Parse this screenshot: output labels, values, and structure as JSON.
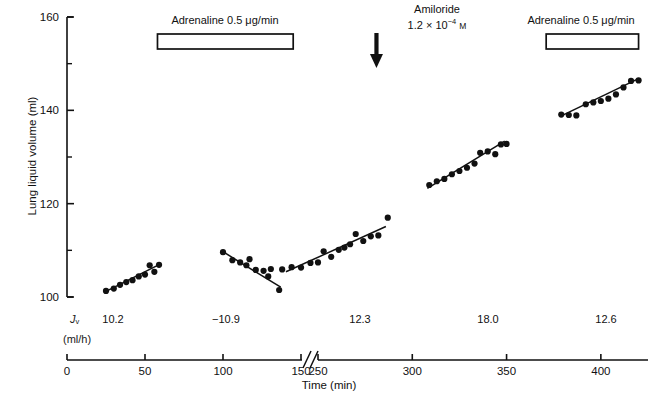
{
  "chart_data": {
    "type": "scatter",
    "title": "",
    "xlabel": "Time (min)",
    "ylabel": "Lung liquid volume (ml)",
    "xlim": [
      0,
      425
    ],
    "ylim": [
      100,
      160
    ],
    "grid": false,
    "legend": "none",
    "x_ticks": [
      0,
      50,
      100,
      150,
      250,
      300,
      350,
      400
    ],
    "y_ticks": [
      100,
      120,
      140,
      160
    ],
    "y_minor_ticks": [
      110,
      130,
      150
    ],
    "axis_break": {
      "after": 150,
      "before": 250,
      "symbol": "//"
    },
    "series": [
      {
        "name": "control-1",
        "jv": 10.2,
        "points": [
          {
            "x": 25,
            "y": 101.3
          },
          {
            "x": 30,
            "y": 101.8
          },
          {
            "x": 34,
            "y": 102.6
          },
          {
            "x": 38,
            "y": 103.2
          },
          {
            "x": 42,
            "y": 103.6
          },
          {
            "x": 46,
            "y": 104.4
          },
          {
            "x": 50,
            "y": 104.8
          },
          {
            "x": 53,
            "y": 106.8
          },
          {
            "x": 56,
            "y": 105.4
          },
          {
            "x": 59,
            "y": 106.9
          }
        ],
        "fit": {
          "x1": 25,
          "y1": 101.2,
          "x2": 60,
          "y2": 107.1
        }
      },
      {
        "name": "adrenaline-1",
        "jv": -10.9,
        "points": [
          {
            "x": 100,
            "y": 109.6
          },
          {
            "x": 106,
            "y": 107.9
          },
          {
            "x": 111,
            "y": 107.4
          },
          {
            "x": 115,
            "y": 106.8
          },
          {
            "x": 117,
            "y": 108.1
          },
          {
            "x": 121,
            "y": 105.8
          },
          {
            "x": 126,
            "y": 105.6
          },
          {
            "x": 129,
            "y": 104.4
          },
          {
            "x": 136,
            "y": 101.5
          }
        ],
        "fit": {
          "x1": 100,
          "y1": 109.7,
          "x2": 137,
          "y2": 102.1
        }
      },
      {
        "name": "control-2",
        "jv": 12.3,
        "points": [
          {
            "x": 225,
            "y": 106.0
          },
          {
            "x": 231,
            "y": 105.9
          },
          {
            "x": 236,
            "y": 106.4
          },
          {
            "x": 241,
            "y": 106.3
          },
          {
            "x": 246,
            "y": 107.3
          },
          {
            "x": 250,
            "y": 107.4
          },
          {
            "x": 253,
            "y": 109.8
          },
          {
            "x": 257,
            "y": 108.6
          },
          {
            "x": 261,
            "y": 110.1
          },
          {
            "x": 264,
            "y": 110.6
          },
          {
            "x": 267,
            "y": 111.3
          },
          {
            "x": 270,
            "y": 113.5
          },
          {
            "x": 274,
            "y": 112.0
          },
          {
            "x": 278,
            "y": 113.0
          },
          {
            "x": 282,
            "y": 113.2
          },
          {
            "x": 287,
            "y": 117.0
          }
        ],
        "fit": {
          "x1": 233,
          "y1": 105.4,
          "x2": 286,
          "y2": 115.1
        }
      },
      {
        "name": "amiloride",
        "jv": 18.0,
        "points": [
          {
            "x": 309,
            "y": 124.0
          },
          {
            "x": 313,
            "y": 124.8
          },
          {
            "x": 317,
            "y": 125.3
          },
          {
            "x": 321,
            "y": 126.3
          },
          {
            "x": 325,
            "y": 127.0
          },
          {
            "x": 329,
            "y": 127.7
          },
          {
            "x": 333,
            "y": 128.6
          },
          {
            "x": 336,
            "y": 130.9
          },
          {
            "x": 340,
            "y": 131.2
          },
          {
            "x": 344,
            "y": 130.6
          },
          {
            "x": 347,
            "y": 132.7
          },
          {
            "x": 350,
            "y": 132.8
          }
        ],
        "fit": {
          "x1": 308,
          "y1": 123.3,
          "x2": 349,
          "y2": 133.4
        }
      },
      {
        "name": "adrenaline-2",
        "jv": 12.6,
        "points": [
          {
            "x": 379,
            "y": 139.1
          },
          {
            "x": 383,
            "y": 139.0
          },
          {
            "x": 387,
            "y": 138.9
          },
          {
            "x": 392,
            "y": 141.3
          },
          {
            "x": 396,
            "y": 141.7
          },
          {
            "x": 400,
            "y": 142.0
          },
          {
            "x": 404,
            "y": 142.5
          },
          {
            "x": 408,
            "y": 143.4
          },
          {
            "x": 412,
            "y": 144.9
          },
          {
            "x": 416,
            "y": 146.3
          },
          {
            "x": 420,
            "y": 146.4
          }
        ],
        "fit": {
          "x1": 379,
          "y1": 138.8,
          "x2": 420,
          "y2": 146.8
        }
      }
    ],
    "annotations": [
      {
        "name": "adrenaline-bar-1",
        "label": "Adrenaline 0.5 μg/min",
        "kind": "bar",
        "x_start": 58,
        "x_end": 145
      },
      {
        "name": "amiloride-arrow",
        "label_line1": "Amiloride",
        "label_line2_prefix": "1.2 × 10",
        "label_line2_exp": "−4",
        "label_line2_unit": "M",
        "kind": "arrow",
        "x": 281
      },
      {
        "name": "adrenaline-bar-2",
        "label": "Adrenaline 0.5 μg/min",
        "kind": "bar",
        "x_start": 371,
        "x_end": 420
      }
    ],
    "jv_row": {
      "symbol": "J",
      "symbol_sub": "v",
      "units": "(ml/h)",
      "values": [
        "10.2",
        "−10.9",
        "12.3",
        "18.0",
        "12.6"
      ]
    }
  },
  "colors": {
    "axis": "#111111",
    "marker": "#111111",
    "fit_line": "#111111",
    "background": "#ffffff"
  }
}
